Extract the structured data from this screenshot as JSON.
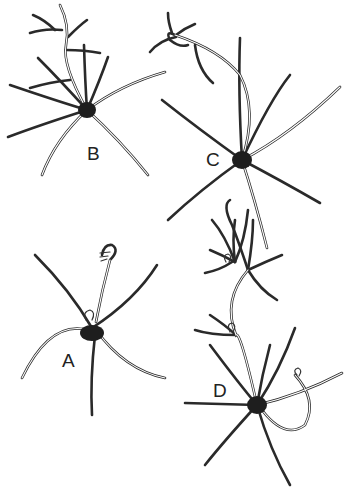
{
  "figure": {
    "type": "scientific line illustration",
    "panels": [
      {
        "id": "B",
        "label": "B",
        "description": "central body with radiating filaments and branched upper stalk"
      },
      {
        "id": "C",
        "label": "C",
        "description": "central body with radiating filaments and long arched stalk with hooked tip"
      },
      {
        "id": "A",
        "label": "A",
        "description": "central body with radiating filaments and one stalk ending in a curled tip"
      },
      {
        "id": "D",
        "label": "D",
        "description": "central body with radiating filaments, branched upper stalk with small loops and a curved side stalk"
      }
    ],
    "colors": {
      "ink": "#222222",
      "background": "#ffffff"
    }
  }
}
